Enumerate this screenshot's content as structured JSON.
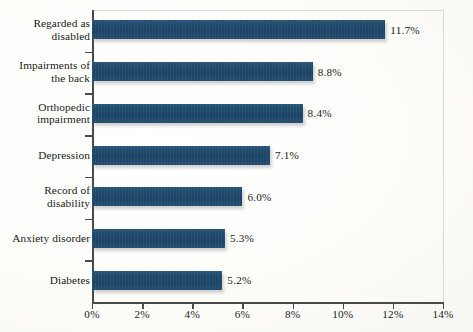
{
  "chart_data": {
    "type": "bar",
    "orientation": "horizontal",
    "title": "",
    "subtitle": "",
    "xlabel": "",
    "ylabel": "",
    "categories": [
      "Regarded as\ndisabled",
      "Impairments of\nthe back",
      "Orthopedic\nimpairment",
      "Depression",
      "Record of\ndisability",
      "Anxiety disorder",
      "Diabetes"
    ],
    "values": [
      11.7,
      8.8,
      8.4,
      7.1,
      6.0,
      5.3,
      5.2
    ],
    "data_labels": [
      "11.7%",
      "8.8%",
      "8.4%",
      "7.1%",
      "6.0%",
      "5.3%",
      "5.2%"
    ],
    "xlim": [
      0,
      14
    ],
    "xticks": [
      0,
      2,
      4,
      6,
      8,
      10,
      12,
      14
    ],
    "xtick_labels": [
      "0%",
      "2%",
      "4%",
      "6%",
      "8%",
      "10%",
      "12%",
      "14%"
    ],
    "grid": false,
    "legend": null,
    "series_color": "#1f4a6b",
    "background_color": "#fdfdfb",
    "axis_color": "#4a4a48"
  }
}
